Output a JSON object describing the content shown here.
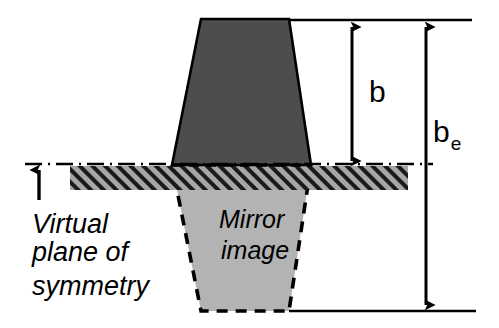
{
  "diagram": {
    "background_color": "#ffffff",
    "stroke_color": "#000000",
    "shapes": {
      "real_body": {
        "name": "real-body",
        "fill_color": "#4d4d4d",
        "top_left_x": 201,
        "top_right_x": 289,
        "bottom_left_x": 172,
        "bottom_right_x": 311,
        "top_y": 19,
        "bottom_y": 165
      },
      "mirror_body": {
        "name": "mirror-body",
        "fill_color": "#b3b3b3",
        "label_line1": "Mirror",
        "label_line2": "image",
        "top_left_x": 172,
        "top_right_x": 311,
        "bottom_left_x": 201,
        "bottom_right_x": 289,
        "top_y": 165,
        "bottom_y": 311
      },
      "symmetry_band": {
        "name": "symmetry-band",
        "fill_color": "#a6a6a6",
        "hatch_color": "#1a1a1a",
        "left_x": 70,
        "right_x": 408,
        "top_y": 166,
        "bottom_y": 190
      }
    },
    "lines": {
      "centerline": {
        "name": "virtual-plane-centerline",
        "style": "dash-dot",
        "y": 164,
        "left_x": 25,
        "right_x": 433
      },
      "top_reference": {
        "name": "top-reference-line",
        "style": "solid",
        "y": 20,
        "left_x": 286,
        "right_x": 472
      },
      "bottom_reference": {
        "name": "bottom-reference-line",
        "style": "solid",
        "y": 311,
        "left_x": 289,
        "right_x": 476
      }
    },
    "dimensions": [
      {
        "name": "dimension-b",
        "label": "b",
        "subscript": "",
        "x": 352,
        "top_y": 25,
        "bottom_y": 163,
        "label_x": 369,
        "label_y": 102,
        "arrow_heads": "both"
      },
      {
        "name": "dimension-be",
        "label": "b",
        "subscript": "e",
        "x": 426,
        "top_y": 25,
        "bottom_y": 307,
        "label_x": 433,
        "label_y": 142,
        "arrow_heads": "both"
      }
    ],
    "annotations": [
      {
        "name": "virtual-plane-annotation",
        "lines": [
          "Virtual",
          "plane of",
          "symmetry"
        ],
        "text_x": 32,
        "line_y": [
          233,
          261,
          295
        ],
        "pointer": {
          "name": "virtual-plane-pointer-arrow",
          "x": 39,
          "tail_y": 200,
          "tip_y": 168,
          "arrow_heads": "up"
        }
      }
    ]
  }
}
